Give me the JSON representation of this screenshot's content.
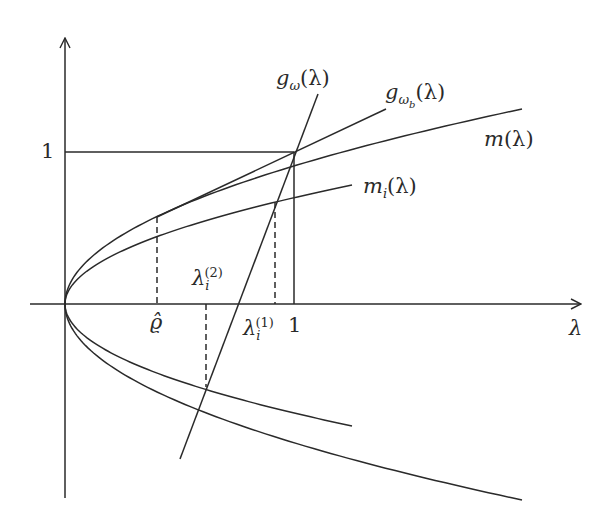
{
  "diagram": {
    "type": "function-plot",
    "stroke_color": "#2a2a2a",
    "axes": {
      "origin_px": [
        65,
        304
      ],
      "x_axis": {
        "from_px": [
          30,
          304
        ],
        "to_px": [
          581,
          304
        ],
        "label": "λ"
      },
      "y_axis": {
        "from_px": [
          65,
          498
        ],
        "to_px": [
          65,
          38
        ],
        "label": ""
      },
      "unit_px": {
        "x": 229,
        "y": 152
      }
    },
    "ticks": {
      "y_one": "1",
      "x_one": "1",
      "rho_hat": "ϱ̂"
    },
    "guides": {
      "horizontal_at_1": {
        "from_px": [
          65,
          152
        ],
        "to_px": [
          294,
          152
        ],
        "style": "solid"
      },
      "vertical_at_1": {
        "from_px": [
          294,
          152
        ],
        "to_px": [
          294,
          304
        ],
        "style": "solid"
      },
      "dashed_rho_hat": {
        "from_px": [
          157,
          217
        ],
        "to_px": [
          157,
          304
        ],
        "style": "dashed"
      },
      "dashed_lambda1": {
        "from_px": [
          275,
          202
        ],
        "to_px": [
          275,
          304
        ],
        "style": "dashed"
      },
      "dashed_lambda2": {
        "from_px": [
          206,
          304
        ],
        "to_px": [
          206,
          387
        ],
        "style": "dashed"
      }
    },
    "curves": {
      "m": {
        "label_base": "m",
        "label_arg": "(λ)",
        "end_px": [
          522,
          109
        ],
        "shape": "sqrt-parabola (upper & lower branches)"
      },
      "m_i": {
        "label_base": "m",
        "label_sub": "i",
        "label_arg": "(λ)",
        "end_px_upper": [
          352,
          185
        ],
        "end_px_lower": [
          352,
          426
        ],
        "shape": "sqrt-parabola (upper & lower branches)"
      },
      "g_omega": {
        "label_base": "g",
        "label_sub": "ω",
        "label_arg": "(λ)",
        "from_px": [
          318,
          94
        ],
        "to_px": [
          180,
          459
        ],
        "shape": "line"
      },
      "g_omega_b": {
        "label_base": "g",
        "label_sub": "ω",
        "label_subsub": "b",
        "label_arg": "(λ)",
        "from_px": [
          157,
          217
        ],
        "to_px": [
          386,
          109
        ],
        "shape": "tangent line"
      }
    },
    "point_labels": {
      "lambda1": {
        "base": "λ",
        "sub": "i",
        "sup": "(1)"
      },
      "lambda2": {
        "base": "λ",
        "sub": "i",
        "sup": "(2)"
      }
    }
  }
}
